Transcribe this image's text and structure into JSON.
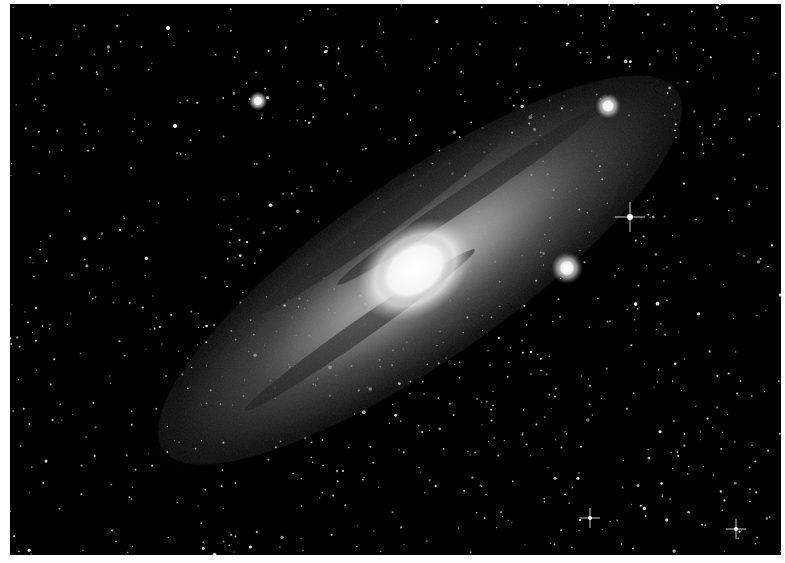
{
  "image": {
    "subject": "Andromeda Galaxy (spiral galaxy) on a dense star field",
    "border_color": "#ffffff",
    "background_color": "#000000",
    "frame": {
      "x": 10,
      "y": 4,
      "width": 771,
      "height": 551
    }
  },
  "galaxy": {
    "center": {
      "x": 420,
      "y": 270
    },
    "angle_deg": -35,
    "disk": {
      "rx": 330,
      "ry": 95
    },
    "inner_disk": {
      "rx": 220,
      "ry": 60
    },
    "core": {
      "x": 415,
      "y": 270,
      "rx": 42,
      "ry": 30,
      "angle_deg": -35
    },
    "dust_lanes": [
      {
        "x": 380,
        "y": 225,
        "rx": 150,
        "ry": 12,
        "angle_deg": -36
      },
      {
        "x": 470,
        "y": 195,
        "rx": 160,
        "ry": 10,
        "angle_deg": -34
      },
      {
        "x": 360,
        "y": 330,
        "rx": 140,
        "ry": 10,
        "angle_deg": -35
      }
    ]
  },
  "companions": [
    {
      "name": "M32",
      "x": 567,
      "y": 268,
      "r": 10
    },
    {
      "name": "M110",
      "x": 258,
      "y": 101,
      "r": 6
    },
    {
      "name": "upper-right-knot",
      "x": 608,
      "y": 106,
      "r": 8
    }
  ],
  "bright_stars": [
    {
      "x": 630,
      "y": 217,
      "r": 3,
      "spikes": true
    },
    {
      "x": 590,
      "y": 518,
      "r": 2,
      "spikes": true
    },
    {
      "x": 736,
      "y": 529,
      "r": 2,
      "spikes": true
    },
    {
      "x": 168,
      "y": 28,
      "r": 2,
      "spikes": false
    },
    {
      "x": 175,
      "y": 126,
      "r": 2,
      "spikes": false
    }
  ],
  "starfield": {
    "count": 900,
    "seed": 7
  }
}
